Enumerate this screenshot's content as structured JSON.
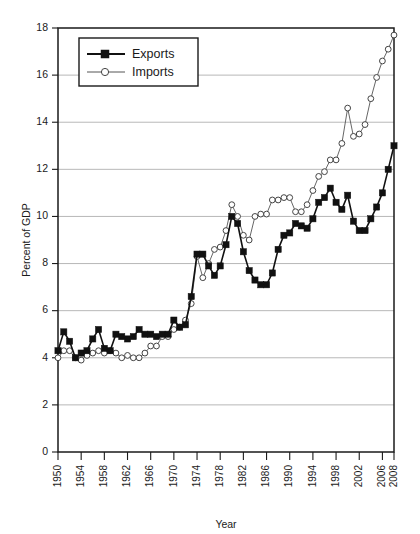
{
  "chart_data": {
    "type": "line",
    "title": "",
    "xlabel": "Year",
    "ylabel": "Percent of GDP",
    "xlim": [
      1950,
      2008
    ],
    "ylim": [
      0,
      18
    ],
    "ytick_step": 2,
    "yticks": [
      0,
      2,
      4,
      6,
      8,
      10,
      12,
      14,
      16,
      18
    ],
    "xticks": [
      1950,
      1954,
      1958,
      1962,
      1966,
      1970,
      1974,
      1978,
      1982,
      1986,
      1990,
      1994,
      1998,
      2002,
      2006,
      2008
    ],
    "xtick_labels": [
      "1950",
      "1954",
      "1958",
      "1962",
      "1966",
      "1970",
      "1974",
      "1978",
      "1982",
      "1986",
      "1990",
      "1994",
      "1998",
      "2002",
      "2006",
      "2008"
    ],
    "grid": true,
    "grid_axis": "y",
    "legend_position": "upper-left",
    "x": [
      1950,
      1951,
      1952,
      1953,
      1954,
      1955,
      1956,
      1957,
      1958,
      1959,
      1960,
      1961,
      1962,
      1963,
      1964,
      1965,
      1966,
      1967,
      1968,
      1969,
      1970,
      1971,
      1972,
      1973,
      1974,
      1975,
      1976,
      1977,
      1978,
      1979,
      1980,
      1981,
      1982,
      1983,
      1984,
      1985,
      1986,
      1987,
      1988,
      1989,
      1990,
      1991,
      1992,
      1993,
      1994,
      1995,
      1996,
      1997,
      1998,
      1999,
      2000,
      2001,
      2002,
      2003,
      2004,
      2005,
      2006,
      2007,
      2008
    ],
    "series": [
      {
        "name": "Exports",
        "marker": "filled-square",
        "values": [
          4.3,
          5.1,
          4.7,
          4.0,
          4.2,
          4.3,
          4.8,
          5.2,
          4.4,
          4.3,
          5.0,
          4.9,
          4.8,
          4.9,
          5.2,
          5.0,
          5.0,
          4.9,
          5.0,
          5.0,
          5.6,
          5.3,
          5.4,
          6.6,
          8.4,
          8.4,
          7.9,
          7.5,
          7.9,
          8.8,
          10.0,
          9.7,
          8.5,
          7.7,
          7.3,
          7.1,
          7.1,
          7.6,
          8.6,
          9.2,
          9.3,
          9.7,
          9.6,
          9.5,
          9.9,
          10.6,
          10.8,
          11.2,
          10.6,
          10.3,
          10.9,
          9.8,
          9.4,
          9.4,
          9.9,
          10.4,
          11.0,
          12.0,
          13.0
        ]
      },
      {
        "name": "Imports",
        "marker": "open-circle",
        "values": [
          4.0,
          4.3,
          4.3,
          4.0,
          3.9,
          4.1,
          4.2,
          4.3,
          4.2,
          4.3,
          4.2,
          4.0,
          4.1,
          4.0,
          4.0,
          4.2,
          4.5,
          4.5,
          4.9,
          4.9,
          5.2,
          5.3,
          5.6,
          6.3,
          8.3,
          7.4,
          8.0,
          8.6,
          8.7,
          9.4,
          10.5,
          10.0,
          9.2,
          9.0,
          10.0,
          10.1,
          10.1,
          10.7,
          10.7,
          10.8,
          10.8,
          10.2,
          10.2,
          10.5,
          11.1,
          11.7,
          11.9,
          12.4,
          12.4,
          13.1,
          14.6,
          13.4,
          13.5,
          13.9,
          15.0,
          15.9,
          16.6,
          17.1,
          17.7
        ]
      }
    ]
  },
  "legend": {
    "entries": [
      {
        "label": "Exports"
      },
      {
        "label": "Imports"
      }
    ]
  },
  "axes": {
    "y_title": "Percent of GDP",
    "x_title": "Year"
  }
}
